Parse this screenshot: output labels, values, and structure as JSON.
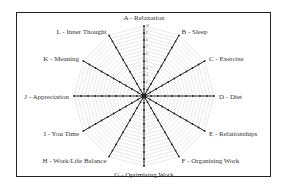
{
  "chart_data": {
    "type": "radar",
    "title": "",
    "categories": [
      "A - Relaxation",
      "B - Sleep",
      "C - Exercise",
      "D - Diet",
      "E - Relationships",
      "F - Organising Work",
      "G - Optimising Work",
      "H - Work/Life Balance",
      "I - You Time",
      "J - Appreciation",
      "K - Meaning",
      "L - Inner Thought"
    ],
    "scale": {
      "min": 0,
      "max": 10,
      "ticks": [
        1,
        2,
        3,
        4,
        5,
        6,
        7,
        8,
        9,
        10
      ]
    },
    "series": [
      {
        "name": "axis",
        "values": [
          10,
          10,
          10,
          10,
          10,
          10,
          10,
          10,
          10,
          10,
          10,
          10
        ]
      }
    ],
    "grid": true,
    "grid_shape": "dodecagon",
    "legend": "none"
  },
  "colors": {
    "axis": "#222222",
    "grid": "#cfcfcf",
    "frame": "#222222",
    "text": "#333333"
  }
}
